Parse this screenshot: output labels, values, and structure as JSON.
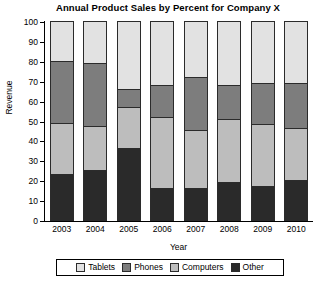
{
  "chart_data": {
    "type": "bar",
    "subtype": "stacked-bar-percent",
    "title": "Annual Product Sales by Percent for Company X",
    "xlabel": "Year",
    "ylabel": "Revenue",
    "ylim": [
      0,
      100
    ],
    "ytick_step": 10,
    "yticks": [
      0,
      10,
      20,
      30,
      40,
      50,
      60,
      70,
      80,
      90,
      100
    ],
    "ytick_labels": [
      "0",
      "10",
      "20",
      "30",
      "40",
      "50",
      "60",
      "70",
      "80",
      "90",
      "100"
    ],
    "grid": false,
    "legend_position": "bottom",
    "categories": [
      "2003",
      "2004",
      "2005",
      "2006",
      "2007",
      "2008",
      "2009",
      "2010"
    ],
    "stack_order_bottom_to_top": [
      "Other",
      "Computers",
      "Phones",
      "Tablets"
    ],
    "series": [
      {
        "name": "Other",
        "color": "#2a2a2a",
        "values": [
          23,
          25,
          36,
          16,
          16,
          19,
          17,
          20
        ]
      },
      {
        "name": "Computers",
        "color": "#bdbdbd",
        "values": [
          26,
          22,
          21,
          36,
          29,
          32,
          31,
          26
        ]
      },
      {
        "name": "Phones",
        "color": "#7d7d7d",
        "values": [
          31,
          32,
          9,
          16,
          27,
          17,
          21,
          23
        ]
      },
      {
        "name": "Tablets",
        "color": "#e2e2e2",
        "values": [
          20,
          21,
          34,
          32,
          28,
          32,
          31,
          31
        ]
      }
    ],
    "legend": [
      {
        "label": "Tablets",
        "color": "#e2e2e2"
      },
      {
        "label": "Phones",
        "color": "#7d7d7d"
      },
      {
        "label": "Computers",
        "color": "#bdbdbd"
      },
      {
        "label": "Other",
        "color": "#2a2a2a"
      }
    ]
  }
}
